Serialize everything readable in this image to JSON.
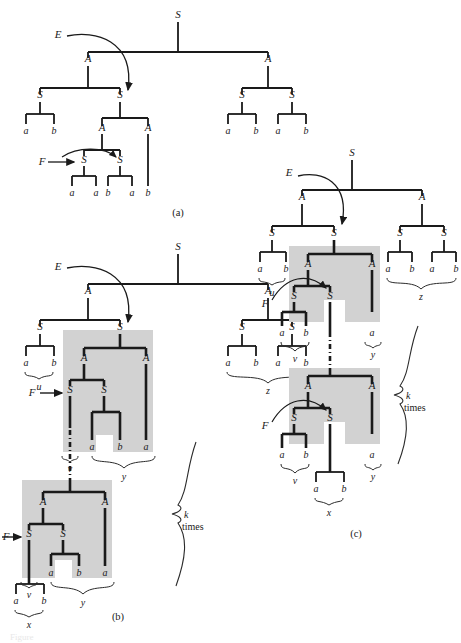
{
  "figure": {
    "kind": "parse-tree-diagram",
    "panels": [
      {
        "id": "a",
        "caption": "(a)"
      },
      {
        "id": "b",
        "caption": "(b)"
      },
      {
        "id": "c",
        "caption": "(c)"
      }
    ],
    "colors": {
      "ink": "#1a1a1a",
      "shade": "#d2d2d2",
      "brace": "#2b2b2b",
      "background": "#ffffff"
    },
    "node_labels": {
      "start": "S",
      "nonterminal_a": "A",
      "nonterminal_s": "S",
      "terminal_a": "a",
      "terminal_b": "b"
    },
    "pointer_labels": {
      "E": "E",
      "F": "F"
    },
    "substring_labels": {
      "u": "u",
      "v": "v",
      "x": "x",
      "y": "y",
      "z": "z"
    },
    "repeat_label": {
      "line1": "k",
      "line2": "times"
    },
    "cut_caption": "Figure"
  },
  "panel_a": {
    "caption": "(a)",
    "root": "S",
    "pointer_E": "E",
    "pointer_F": "F",
    "nodes": [
      {
        "name": "root-S",
        "label": "S",
        "x": 178,
        "y": 18
      },
      {
        "name": "left-A",
        "label": "A",
        "x": 88,
        "y": 62
      },
      {
        "name": "right-A",
        "label": "A",
        "x": 268,
        "y": 62
      },
      {
        "name": "left-A-left-S",
        "label": "S",
        "x": 40,
        "y": 98
      },
      {
        "name": "left-A-right-S",
        "label": "S",
        "x": 120,
        "y": 98
      },
      {
        "name": "right-A-left-S",
        "label": "S",
        "x": 242,
        "y": 98
      },
      {
        "name": "right-A-right-S",
        "label": "S",
        "x": 292,
        "y": 98
      },
      {
        "name": "inner-A",
        "label": "A",
        "x": 102,
        "y": 130
      },
      {
        "name": "inner-A-right",
        "label": "A",
        "x": 148,
        "y": 130
      },
      {
        "name": "inner-S-left",
        "label": "S",
        "x": 84,
        "y": 162
      },
      {
        "name": "inner-S-right",
        "label": "S",
        "x": 120,
        "y": 162
      }
    ],
    "terminals": [
      "a",
      "b",
      "a",
      "b",
      "a",
      "b",
      "a",
      "a",
      "b",
      "a",
      "b"
    ]
  },
  "panel_b": {
    "caption": "(b)",
    "pointer_E": "E",
    "pointer_F_upper": "F",
    "pointer_F_lower": "F",
    "labels": {
      "u": "u",
      "v": "v",
      "x": "x",
      "y": "y",
      "z": "z"
    },
    "repeat": {
      "k": "k",
      "times": "times"
    }
  },
  "panel_c": {
    "caption": "(c)",
    "pointer_E": "E",
    "pointer_F_upper": "F",
    "pointer_F_lower": "F",
    "labels": {
      "u": "u",
      "v": "v",
      "x": "x",
      "y": "y",
      "z": "z"
    },
    "repeat": {
      "k": "k",
      "times": "times"
    }
  }
}
